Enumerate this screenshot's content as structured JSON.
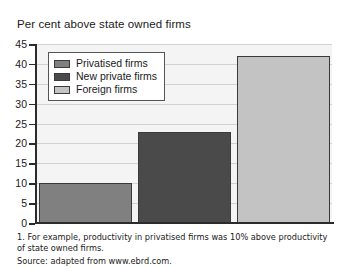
{
  "chart_data": {
    "type": "bar",
    "title": "Per cent above state owned firms",
    "xlabel": "",
    "ylabel": "",
    "ylim": [
      0,
      45
    ],
    "ytick_step": 5,
    "yticks": [
      45,
      40,
      35,
      30,
      25,
      20,
      15,
      10,
      5,
      0
    ],
    "grid": true,
    "legend_position": "top-left inside plot",
    "categories": [
      "Privatised firms",
      "New private firms",
      "Foreign firms"
    ],
    "values": [
      10,
      23,
      42
    ],
    "series": [
      {
        "name": "Privatised firms",
        "value": 10,
        "color": "#808080"
      },
      {
        "name": "New private firms",
        "value": 23,
        "color": "#4a4a4a"
      },
      {
        "name": "Foreign firms",
        "value": 42,
        "color": "#c3c3c3"
      }
    ]
  },
  "legend": {
    "items": [
      {
        "label": "Privatised firms",
        "color": "#808080"
      },
      {
        "label": "New private firms",
        "color": "#4a4a4a"
      },
      {
        "label": "Foreign firms",
        "color": "#c3c3c3"
      }
    ]
  },
  "footnote": {
    "note": "1. For example, productivity in privatised firms was 10% above productivity of state owned firms.",
    "source": "Source: adapted from www.ebrd.com."
  }
}
